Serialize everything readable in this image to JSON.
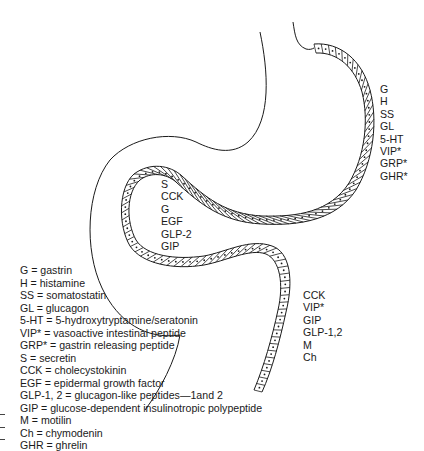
{
  "diagram": {
    "colors": {
      "line": "#1a1a1a",
      "background": "#ffffff"
    },
    "regions": {
      "stomach_body": {
        "labels": [
          "G",
          "H",
          "SS",
          "GL",
          "5-HT",
          "VIP*",
          "GRP*",
          "GHR*"
        ]
      },
      "duodenum": {
        "labels": [
          "S",
          "CCK",
          "G",
          "EGF",
          "GLP-2",
          "GIP"
        ]
      },
      "lower_intestine": {
        "labels": [
          "CCK",
          "VIP*",
          "GIP",
          "GLP-1,2",
          "M",
          "Ch"
        ]
      }
    },
    "legend": [
      "G = gastrin",
      "H = histamine",
      "SS = somatostatin",
      "GL = glucagon",
      "5-HT = 5-hydroxytryptamine/seratonin",
      "VIP* = vasoactive intestinal peptide",
      "GRP* = gastrin releasing peptide",
      "S = secretin",
      "CCK = cholecystokinin",
      "EGF = epidermal growth factor",
      "GLP-1, 2 = glucagon-like peptides—1and 2",
      "GIP = glucose-dependent insulinotropic polypeptide",
      "M = motilin",
      "Ch = chymodenin",
      "GHR = ghrelin"
    ]
  }
}
